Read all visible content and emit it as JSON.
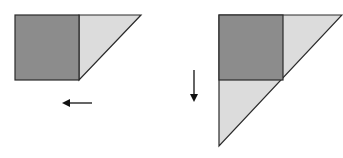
{
  "diagram": {
    "colors": {
      "dark_fill": "#8c8c8c",
      "light_fill": "#dcdcdc",
      "stroke": "#2a2a2a",
      "arrow": "#111111"
    },
    "left_figure": {
      "square": {
        "x": 15,
        "y": 15,
        "size": 65
      },
      "triangle": {
        "points": "80,15 141,15 80,80"
      },
      "arrow": {
        "direction": "left",
        "x1": 92,
        "x2": 62,
        "y": 103
      }
    },
    "right_figure": {
      "outer_triangle": {
        "points": "219,15 343,15 219,146"
      },
      "square": {
        "x": 219,
        "y": 15,
        "size": 64
      },
      "arrow": {
        "direction": "down",
        "x": 194,
        "y1": 70,
        "y2": 102
      }
    }
  }
}
